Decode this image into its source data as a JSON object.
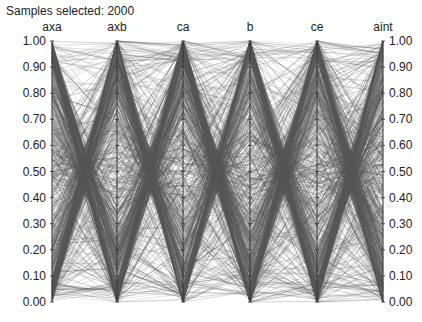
{
  "header": {
    "title": "Samples selected: 2000"
  },
  "chart_data": {
    "type": "parallel_coordinates",
    "title": "Samples selected: 2000",
    "samples_selected": 2000,
    "axes": [
      "axa",
      "axb",
      "ca",
      "b",
      "ce",
      "aint"
    ],
    "axis_range": [
      0.0,
      1.0
    ],
    "tick_labels": [
      "0.00",
      "0.10",
      "0.20",
      "0.30",
      "0.40",
      "0.50",
      "0.60",
      "0.70",
      "0.80",
      "0.90",
      "1.00"
    ],
    "left_axis": "axa",
    "right_axis": "aint",
    "line_color": "#555555",
    "grid": false
  },
  "layout": {
    "axis_x": [
      52,
      117,
      183,
      250,
      317,
      383
    ],
    "y_top": 41,
    "y_bottom": 302
  }
}
